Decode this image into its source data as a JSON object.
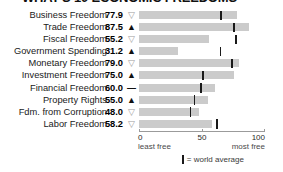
{
  "title": "WHAT'S 10 ECONOMIC FREEDOMS",
  "chart_data": {
    "type": "bar",
    "title": "WHAT'S 10 ECONOMIC FREEDOMS",
    "xlabel": "",
    "ylabel": "",
    "xlim": [
      0,
      100
    ],
    "grid": false,
    "orientation": "horizontal",
    "categories": [
      "Business Freedom",
      "Trade Freedom",
      "Fiscal Freedom",
      "Government Spending",
      "Monetary Freedom",
      "Investment Freedom",
      "Financial Freedom",
      "Property Rights",
      "Fdm. from Corruption",
      "Labor Freedom"
    ],
    "values": [
      77.9,
      87.5,
      55.2,
      31.2,
      79.0,
      75.0,
      60.0,
      55.0,
      48.0,
      58.2
    ],
    "trends": [
      "down",
      "up",
      "down",
      "up",
      "down",
      "up",
      "flat",
      "up",
      "down",
      "down"
    ],
    "world_average": [
      64.3,
      74.8,
      76.3,
      63.9,
      73.4,
      50.2,
      48.5,
      43.5,
      40.4,
      61.5
    ],
    "legend": [
      "= world average"
    ],
    "axis": {
      "ticks": [
        0,
        50,
        100
      ],
      "tick_labels": [
        "0",
        "50",
        "100"
      ],
      "left_caption": "least free",
      "right_caption": "most free"
    }
  },
  "rows": [
    {
      "label": "Business Freedom",
      "value": "77.9",
      "trend": "down",
      "bar": 77.9,
      "avg": 64.3,
      "trend_glyph": "▽"
    },
    {
      "label": "Trade Freedom",
      "value": "87.5",
      "trend": "up",
      "bar": 87.5,
      "avg": 74.8,
      "trend_glyph": "▲"
    },
    {
      "label": "Fiscal Freedom",
      "value": "55.2",
      "trend": "down",
      "bar": 55.2,
      "avg": 76.3,
      "trend_glyph": "▽"
    },
    {
      "label": "Government Spending",
      "value": "31.2",
      "trend": "up",
      "bar": 31.2,
      "avg": 63.9,
      "trend_glyph": "▲"
    },
    {
      "label": "Monetary Freedom",
      "value": "79.0",
      "trend": "down",
      "bar": 79.0,
      "avg": 73.4,
      "trend_glyph": "▽"
    },
    {
      "label": "Investment Freedom",
      "value": "75.0",
      "trend": "up",
      "bar": 75.0,
      "avg": 50.2,
      "trend_glyph": "▲"
    },
    {
      "label": "Financial Freedom",
      "value": "60.0",
      "trend": "flat",
      "bar": 60.0,
      "avg": 48.5,
      "trend_glyph": "—"
    },
    {
      "label": "Property Rights",
      "value": "55.0",
      "trend": "up",
      "bar": 55.0,
      "avg": 43.5,
      "trend_glyph": "▲"
    },
    {
      "label": "Fdm. from Corruption",
      "value": "48.0",
      "trend": "down",
      "bar": 48.0,
      "avg": 40.4,
      "trend_glyph": "▽"
    },
    {
      "label": "Labor Freedom",
      "value": "58.2",
      "trend": "down",
      "bar": 58.2,
      "avg": 61.5,
      "trend_glyph": "▽"
    }
  ],
  "axis": {
    "tick0": "0",
    "tick50": "50",
    "tick100": "100",
    "least_free": "least free",
    "most_free": "most free"
  },
  "legend": {
    "text": "= world average"
  },
  "colors": {
    "bar": "#cbcbcb",
    "marker": "#1a1a1a",
    "trend_up": "#111111",
    "trend_down": "#9a9a9a",
    "axis": "#9b9b9b"
  }
}
